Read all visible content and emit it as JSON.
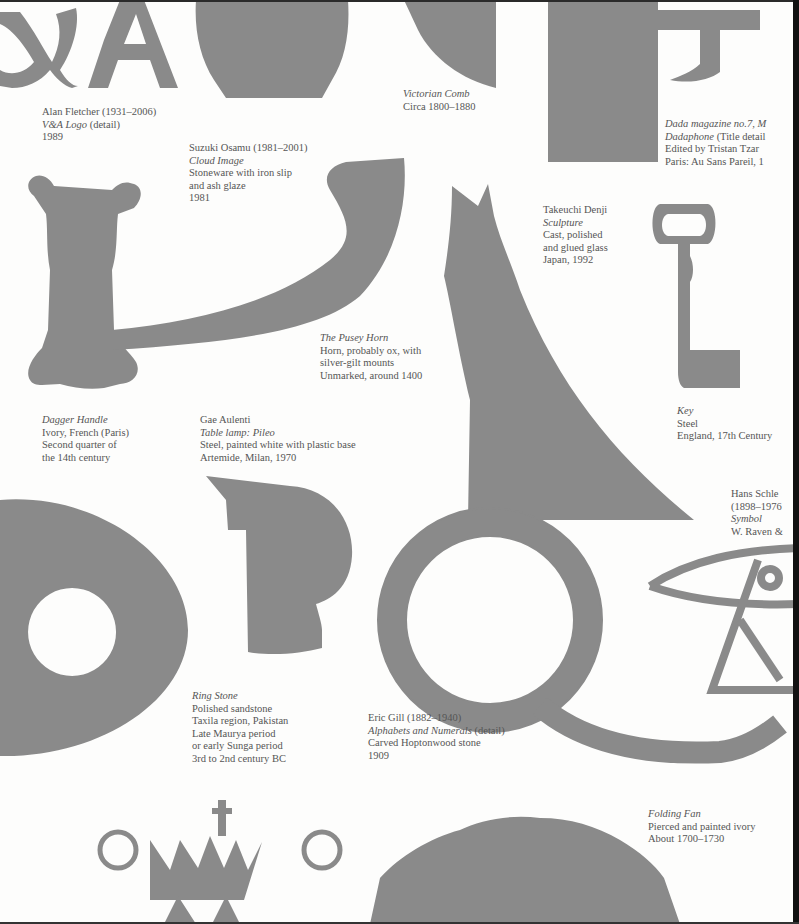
{
  "page": {
    "background": "#fdfdfc",
    "shape_color": "#8a8a8a",
    "text_color": "#555555"
  },
  "captions": {
    "vanda": {
      "lines": [
        "Alan Fletcher (1931–2006)",
        "V&A Logo",
        "(detail)",
        "1989"
      ]
    },
    "cloud": {
      "lines": [
        "Suzuki Osamu (1981–2001)",
        "Cloud Image",
        "Stoneware with iron slip",
        "and ash glaze",
        "1981"
      ]
    },
    "comb": {
      "lines": [
        "Victorian Comb",
        "Circa 1800–1880"
      ]
    },
    "dada": {
      "lines": [
        "Dada magazine no.7, M",
        "Dadaphone",
        "(Title detail",
        "Edited by Tristan Tzar",
        "Paris: Au Sans Pareil, 1"
      ]
    },
    "sculpture": {
      "lines": [
        "Takeuchi Denji",
        "Sculpture",
        "Cast, polished",
        "and glued glass",
        "Japan, 1992"
      ]
    },
    "horn": {
      "lines": [
        "The Pusey Horn",
        "Horn, probably ox, with",
        "silver-gilt mounts",
        "Unmarked, around 1400"
      ]
    },
    "dagger": {
      "lines": [
        "Dagger Handle",
        "Ivory, French (Paris)",
        "Second quarter of",
        "the 14th century"
      ]
    },
    "lamp": {
      "lines": [
        "Gae Aulenti",
        "Table lamp: Pileo",
        "Steel, painted white with plastic base",
        "Artemide, Milan, 1970"
      ]
    },
    "key": {
      "lines": [
        "Key",
        "Steel",
        "England, 17th Century"
      ]
    },
    "symbol": {
      "lines": [
        "Hans Schle",
        "(1898–1976",
        "Symbol",
        "W. Raven &"
      ]
    },
    "ringstone": {
      "lines": [
        "Ring Stone",
        "Polished sandstone",
        "Taxila region, Pakistan",
        "Late Maurya period",
        "or early Sunga period",
        "3rd to 2nd century BC"
      ]
    },
    "gill": {
      "lines": [
        "Eric Gill (1882–1940)",
        "Alphabets and Numerals",
        "(detail)",
        "Carved Hoptonwood stone",
        "1909"
      ]
    },
    "fan": {
      "lines": [
        "Folding Fan",
        "Pierced and painted ivory",
        "About 1700–1730"
      ]
    }
  }
}
